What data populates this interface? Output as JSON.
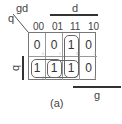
{
  "kmap": {
    "row_var": "q",
    "col_vars": "gd",
    "col_headers": [
      "00",
      "01",
      "11",
      "10"
    ],
    "cells": [
      [
        {
          "value": "0",
          "index": "0"
        },
        {
          "value": "0",
          "index": "1"
        },
        {
          "value": "1",
          "index": "3"
        },
        {
          "value": "0",
          "index": "2"
        }
      ],
      [
        {
          "value": "1",
          "index": "4"
        },
        {
          "value": "1",
          "index": "5"
        },
        {
          "value": "1",
          "index": "7"
        },
        {
          "value": "0",
          "index": "6"
        }
      ]
    ],
    "bar_labels": {
      "top": "d",
      "left": "q",
      "bottom": "g"
    },
    "caption": "(a)"
  }
}
